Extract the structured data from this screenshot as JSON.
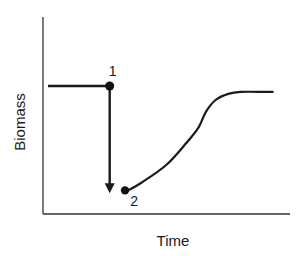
{
  "chart_data": {
    "type": "line",
    "title": "",
    "xlabel": "Time",
    "ylabel": "Biomass",
    "xlim": [
      0,
      100
    ],
    "ylim": [
      0,
      100
    ],
    "grid": false,
    "legend": "none",
    "series": [
      {
        "name": "pre-disturbance biomass",
        "x": [
          2,
          27
        ],
        "y": [
          65,
          65
        ]
      },
      {
        "name": "recovery curve",
        "x": [
          33,
          40,
          50,
          58,
          63,
          66,
          70,
          75,
          80,
          90,
          93
        ],
        "y": [
          11,
          16,
          25,
          36,
          44,
          52,
          58,
          61,
          62,
          62,
          62
        ]
      }
    ],
    "points": [
      {
        "label": "1",
        "x": 27,
        "y": 65
      },
      {
        "label": "2",
        "x": 32,
        "y": 12
      }
    ],
    "annotations": [
      {
        "type": "arrow",
        "from_point": "1",
        "to_point": "2",
        "direction": "down"
      }
    ]
  }
}
